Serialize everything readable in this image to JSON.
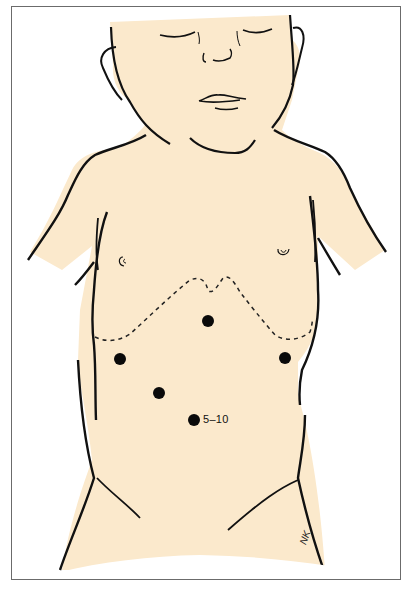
{
  "figure": {
    "skin_color": "#fbe9cc",
    "outline_color": "#111111",
    "frame_color": "#6b6b6b",
    "background": "#ffffff"
  },
  "markers": [
    {
      "id": "upper-midline",
      "x": 208,
      "y": 321
    },
    {
      "id": "left-flank",
      "x": 120,
      "y": 359
    },
    {
      "id": "right-flank",
      "x": 285,
      "y": 358
    },
    {
      "id": "left-lower",
      "x": 159,
      "y": 393
    },
    {
      "id": "lower-midline",
      "x": 194,
      "y": 420,
      "label": "5–10"
    }
  ],
  "annotations": {
    "lower_marker_label": "5–10",
    "artist_signature": "NK"
  },
  "lines": {
    "liver_edge": "dashed"
  }
}
